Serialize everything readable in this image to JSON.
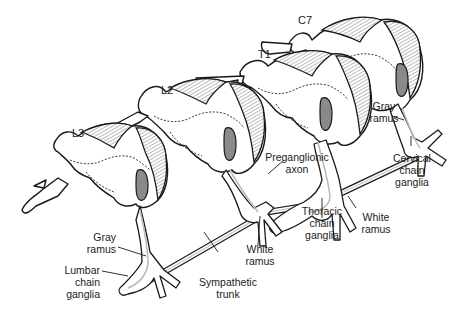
{
  "figure": {
    "segments": [
      {
        "id": "L3",
        "label": "L3"
      },
      {
        "id": "L2",
        "label": "L2"
      },
      {
        "id": "T1",
        "label": "T1"
      },
      {
        "id": "C7",
        "label": "C7"
      }
    ],
    "labels": {
      "gray_ramus_cervical": [
        "Gray",
        "ramus"
      ],
      "cervical_chain_ganglia": [
        "Cervical",
        "chain",
        "ganglia"
      ],
      "preganglionic_axon": [
        "Preganglionic",
        "axon"
      ],
      "thoracic_chain_ganglia": [
        "Thoracic",
        "chain",
        "ganglia"
      ],
      "white_ramus_thoracic": [
        "White",
        "ramus"
      ],
      "white_ramus_lumbar": [
        "White",
        "ramus"
      ],
      "gray_ramus_lumbar": [
        "Gray",
        "ramus"
      ],
      "lumbar_chain_ganglia": [
        "Lumbar",
        "chain",
        "ganglia"
      ],
      "sympathetic_trunk": [
        "Sympathetic",
        "trunk"
      ]
    },
    "colors": {
      "outline": "#1a1a1a",
      "gray_matter_fill": "#8a8a8a",
      "axon_highlight": "#bdbdbd",
      "background": "#ffffff"
    }
  }
}
